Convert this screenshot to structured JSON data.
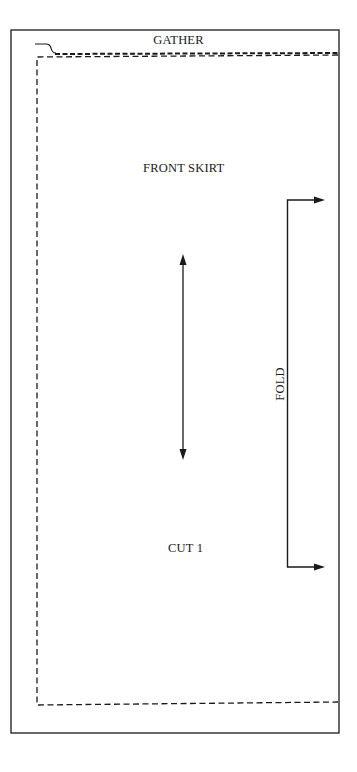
{
  "pattern_piece": {
    "name": "FRONT SKIRT",
    "edge_label": "GATHER",
    "cut_instruction": "CUT 1",
    "fold_label": "FOLD"
  },
  "colors": {
    "line": "#1a1a1a",
    "background": "#ffffff"
  },
  "icons": {
    "grainline": "double-headed-arrow",
    "fold_bracket": "bracket-with-arrows"
  }
}
